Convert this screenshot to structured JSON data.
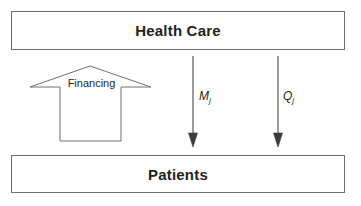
{
  "diagram": {
    "title_hidden": "",
    "nodes": [
      {
        "id": "health_care",
        "label": "Health Care"
      },
      {
        "id": "patients",
        "label": "Patients"
      }
    ],
    "flows": [
      {
        "id": "financing",
        "label": "Financing",
        "direction": "up",
        "style": "block-arrow",
        "from": "patients",
        "to": "health_care"
      },
      {
        "id": "m_j",
        "symbol": "M",
        "subscript": "j",
        "direction": "down",
        "style": "line-arrow",
        "from": "health_care",
        "to": "patients"
      },
      {
        "id": "q_j",
        "symbol": "Q",
        "subscript": "j",
        "direction": "down",
        "style": "line-arrow",
        "from": "health_care",
        "to": "patients"
      }
    ],
    "colors": {
      "stroke": "#6e6e6e",
      "arrow_stroke": "#58595b",
      "text": "#231f20",
      "background": "#ffffff"
    }
  }
}
